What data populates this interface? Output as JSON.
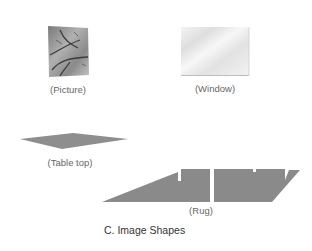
{
  "figure": {
    "caption": "C. Image Shapes",
    "items": [
      {
        "id": "picture",
        "label": "(Picture)"
      },
      {
        "id": "window",
        "label": "(Window)"
      },
      {
        "id": "table-top",
        "label": "(Table top)"
      },
      {
        "id": "rug",
        "label": "(Rug)"
      }
    ]
  },
  "colors": {
    "shape_fill": "#8c8c8c",
    "window_fill": "#ececec",
    "picture_fill": "#9a9a9a"
  }
}
